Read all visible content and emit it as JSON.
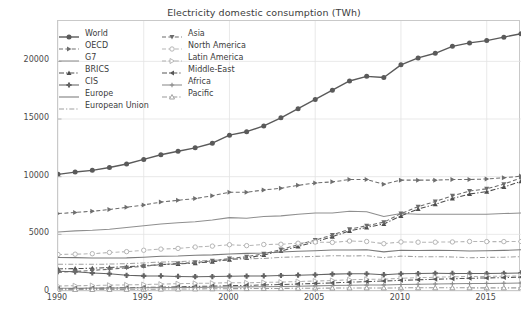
{
  "chart_data": {
    "type": "line",
    "title": "Electricity domestic consumption (TWh)",
    "xlabel": "",
    "ylabel": "",
    "xlim": [
      1990,
      2017
    ],
    "ylim": [
      0,
      23500
    ],
    "grid": true,
    "legend_position": "upper-left",
    "legend_columns": 2,
    "xticks": [
      1990,
      1995,
      2000,
      2005,
      2010,
      2015
    ],
    "yticks": [
      0,
      5000,
      10000,
      15000,
      20000
    ],
    "ytick_labels": [
      "0",
      "5000",
      "10000",
      "15000",
      "20000"
    ],
    "xtick_labels": [
      "1990",
      "1995",
      "2000",
      "2005",
      "2010",
      "2015"
    ],
    "x": [
      1990,
      1991,
      1992,
      1993,
      1994,
      1995,
      1996,
      1997,
      1998,
      1999,
      2000,
      2001,
      2002,
      2003,
      2004,
      2005,
      2006,
      2007,
      2008,
      2009,
      2010,
      2011,
      2012,
      2013,
      2014,
      2015,
      2016,
      2017
    ],
    "series": [
      {
        "name": "World",
        "color": "#5a5a5a",
        "marker": "circle",
        "dash": "solid",
        "values": [
          10200,
          10400,
          10550,
          10800,
          11100,
          11500,
          11900,
          12200,
          12500,
          12900,
          13600,
          13900,
          14400,
          15100,
          15900,
          16700,
          17500,
          18300,
          18700,
          18600,
          19700,
          20300,
          20700,
          21300,
          21600,
          21800,
          22100,
          22400
        ]
      },
      {
        "name": "OECD",
        "color": "#6e6e6e",
        "marker": "triangle-right",
        "dash": "dashed",
        "values": [
          6800,
          6900,
          7000,
          7150,
          7350,
          7550,
          7800,
          7950,
          8100,
          8350,
          8650,
          8650,
          8850,
          9000,
          9250,
          9450,
          9550,
          9750,
          9750,
          9350,
          9700,
          9700,
          9700,
          9750,
          9750,
          9800,
          9900,
          10050
        ]
      },
      {
        "name": "G7",
        "color": "#8f8f8f",
        "marker": "none",
        "dash": "solid",
        "values": [
          5200,
          5300,
          5350,
          5450,
          5600,
          5750,
          5900,
          6000,
          6100,
          6250,
          6450,
          6400,
          6550,
          6600,
          6750,
          6850,
          6850,
          7000,
          6950,
          6550,
          6800,
          6750,
          6750,
          6750,
          6750,
          6750,
          6800,
          6850
        ]
      },
      {
        "name": "BRICS",
        "color": "#4d4d4d",
        "marker": "triangle-up",
        "dash": "dashdot",
        "values": [
          2000,
          2030,
          2060,
          2130,
          2200,
          2280,
          2380,
          2430,
          2500,
          2630,
          2800,
          2950,
          3200,
          3550,
          3950,
          4350,
          4800,
          5300,
          5600,
          5900,
          6600,
          7200,
          7600,
          8100,
          8500,
          8700,
          9100,
          9600
        ]
      },
      {
        "name": "CIS",
        "color": "#636363",
        "marker": "plus-filled",
        "dash": "solid",
        "values": [
          1800,
          1750,
          1650,
          1580,
          1450,
          1400,
          1390,
          1350,
          1330,
          1340,
          1370,
          1380,
          1390,
          1430,
          1460,
          1490,
          1550,
          1580,
          1580,
          1500,
          1580,
          1600,
          1620,
          1610,
          1610,
          1600,
          1620,
          1650
        ]
      },
      {
        "name": "Europe",
        "color": "#7a7a7a",
        "marker": "none",
        "dash": "solid",
        "values": [
          3000,
          2980,
          2950,
          2950,
          2960,
          3020,
          3100,
          3120,
          3180,
          3220,
          3300,
          3350,
          3380,
          3470,
          3530,
          3580,
          3640,
          3650,
          3660,
          3480,
          3620,
          3600,
          3610,
          3590,
          3550,
          3580,
          3610,
          3660
        ]
      },
      {
        "name": "European Union",
        "color": "#a0a0a0",
        "marker": "none",
        "dash": "dashdot",
        "values": [
          2400,
          2410,
          2400,
          2420,
          2460,
          2520,
          2600,
          2630,
          2700,
          2740,
          2820,
          2880,
          2910,
          3000,
          3050,
          3090,
          3140,
          3130,
          3140,
          2980,
          3110,
          3060,
          3060,
          3040,
          2970,
          3000,
          3020,
          3060
        ]
      },
      {
        "name": "Asia",
        "color": "#6b6b6b",
        "marker": "triangle-down",
        "dash": "dashed",
        "values": [
          1700,
          1780,
          1870,
          1980,
          2100,
          2230,
          2370,
          2470,
          2550,
          2700,
          2900,
          3060,
          3320,
          3680,
          4100,
          4500,
          4950,
          5450,
          5750,
          6050,
          6800,
          7400,
          7850,
          8350,
          8750,
          8950,
          9350,
          9900
        ]
      },
      {
        "name": "North America",
        "color": "#b5b5b5",
        "marker": "circle-open",
        "dash": "dashed",
        "values": [
          3250,
          3280,
          3320,
          3430,
          3500,
          3620,
          3720,
          3780,
          3900,
          3980,
          4100,
          4020,
          4120,
          4140,
          4230,
          4330,
          4300,
          4420,
          4380,
          4190,
          4340,
          4320,
          4320,
          4340,
          4380,
          4370,
          4370,
          4380
        ]
      },
      {
        "name": "Latin America",
        "color": "#b0b0b0",
        "marker": "triangle-right-open",
        "dash": "dashed",
        "values": [
          520,
          545,
          565,
          590,
          620,
          650,
          685,
          720,
          750,
          770,
          810,
          800,
          830,
          860,
          910,
          950,
          1000,
          1060,
          1100,
          1110,
          1190,
          1240,
          1280,
          1320,
          1350,
          1350,
          1370,
          1400
        ]
      },
      {
        "name": "Middle-East",
        "color": "#575757",
        "marker": "triangle-left",
        "dash": "dashdot",
        "values": [
          280,
          300,
          320,
          345,
          370,
          395,
          420,
          450,
          480,
          510,
          545,
          575,
          610,
          650,
          690,
          740,
          790,
          850,
          900,
          950,
          1010,
          1060,
          1110,
          1150,
          1190,
          1220,
          1250,
          1290
        ]
      },
      {
        "name": "Africa",
        "color": "#8a8a8a",
        "marker": "plus",
        "dash": "solid",
        "values": [
          320,
          330,
          335,
          345,
          355,
          365,
          380,
          390,
          400,
          415,
          430,
          445,
          460,
          480,
          505,
          530,
          555,
          580,
          600,
          615,
          650,
          670,
          690,
          710,
          730,
          745,
          760,
          780
        ]
      },
      {
        "name": "Pacific",
        "color": "#9a9a9a",
        "marker": "triangle-up-open",
        "dash": "dashdot",
        "values": [
          200,
          208,
          215,
          222,
          230,
          240,
          250,
          258,
          268,
          278,
          290,
          296,
          305,
          312,
          320,
          330,
          338,
          345,
          352,
          350,
          360,
          362,
          363,
          362,
          360,
          358,
          358,
          360
        ]
      }
    ]
  },
  "legend": {
    "column_1": [
      "World",
      "OECD",
      "G7",
      "BRICS",
      "CIS",
      "Europe",
      "European Union"
    ],
    "column_2": [
      "Asia",
      "North America",
      "Latin America",
      "Middle-East",
      "Africa",
      "Pacific"
    ]
  }
}
